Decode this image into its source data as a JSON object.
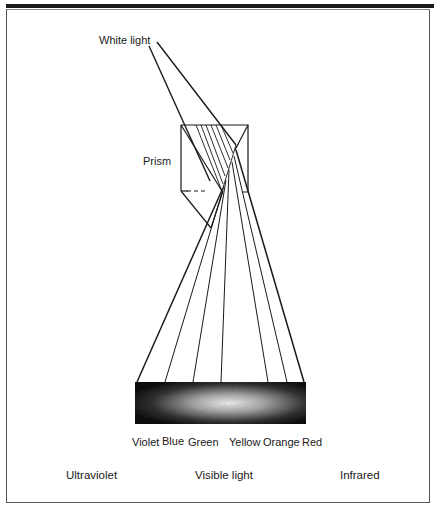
{
  "figure": {
    "title_labels": {
      "white_light": "White light",
      "prism": "Prism"
    },
    "spectrum_colors": [
      {
        "label": "Violet",
        "x": 132
      },
      {
        "label": "Blue",
        "x": 162
      },
      {
        "label": "Green",
        "x": 188
      },
      {
        "label": "Yellow",
        "x": 229
      },
      {
        "label": "Orange",
        "x": 263
      },
      {
        "label": "Red",
        "x": 302
      }
    ],
    "regions": [
      {
        "label": "Ultraviolet",
        "x": 66
      },
      {
        "label": "Visible light",
        "x": 195
      },
      {
        "label": "Infrared",
        "x": 340
      }
    ],
    "colors": {
      "ink": "#1a1a1a",
      "background": "#ffffff"
    }
  }
}
